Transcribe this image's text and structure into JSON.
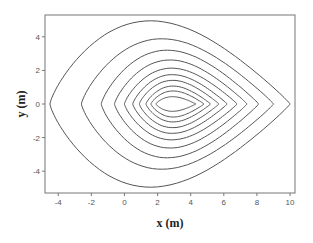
{
  "chart_data": {
    "type": "contour",
    "title": "",
    "xlabel": "x (m)",
    "ylabel": "y (m)",
    "xlim": [
      -4.8,
      10.3
    ],
    "ylim": [
      -5.3,
      5.3
    ],
    "xticks": [
      -4,
      -2,
      0,
      2,
      4,
      6,
      8,
      10
    ],
    "yticks": [
      -4,
      -2,
      0,
      2,
      4
    ],
    "grid": false,
    "legend": null,
    "line_color": "#555555",
    "center": {
      "x": 2.6,
      "y": 0
    },
    "contours": [
      {
        "level": 1,
        "x_left": -4.5,
        "x_right": 10.0,
        "y_top": 5.1,
        "y_bottom": -5.1
      },
      {
        "level": 2,
        "x_left": -2.6,
        "x_right": 9.0,
        "y_top": 4.0,
        "y_bottom": -4.0
      },
      {
        "level": 3,
        "x_left": -1.4,
        "x_right": 8.1,
        "y_top": 3.3,
        "y_bottom": -3.3
      },
      {
        "level": 4,
        "x_left": -0.6,
        "x_right": 7.4,
        "y_top": 2.7,
        "y_bottom": -2.7
      },
      {
        "level": 5,
        "x_left": 0.0,
        "x_right": 6.8,
        "y_top": 2.2,
        "y_bottom": -2.2
      },
      {
        "level": 6,
        "x_left": 0.5,
        "x_right": 6.2,
        "y_top": 1.8,
        "y_bottom": -1.8
      },
      {
        "level": 7,
        "x_left": 0.9,
        "x_right": 5.7,
        "y_top": 1.45,
        "y_bottom": -1.45
      },
      {
        "level": 8,
        "x_left": 1.3,
        "x_right": 5.2,
        "y_top": 1.1,
        "y_bottom": -1.1
      },
      {
        "level": 9,
        "x_left": 1.6,
        "x_right": 4.8,
        "y_top": 0.8,
        "y_bottom": -0.8
      },
      {
        "level": 10,
        "x_left": 1.9,
        "x_right": 4.3,
        "y_top": 0.45,
        "y_bottom": -0.45
      }
    ]
  }
}
